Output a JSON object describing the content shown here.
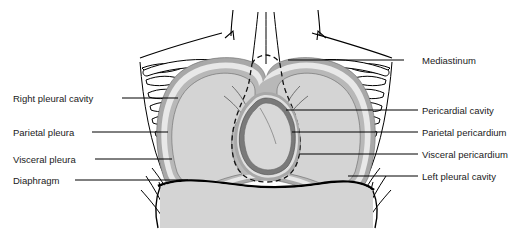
{
  "figure": {
    "type": "anatomical-diagram",
    "background_color": "#ffffff",
    "colors": {
      "outline": "#000000",
      "lung_fill": "#d4d4d4",
      "abdomen_fill": "#d4d4d4",
      "parietal_layer": "#a8a8a8",
      "visceral_layer": "#7a7a7a",
      "cavity_fill": "#e8e8e8",
      "heart_fill": "#d8d8d8",
      "label_text": "#1a1a1a",
      "leader_line": "#000000"
    }
  },
  "labels": {
    "left": [
      {
        "id": "right-pleural-cavity",
        "text": "Right pleural cavity",
        "text_x": 13,
        "text_y": 93,
        "line_x1": 122,
        "line_y1": 98,
        "line_x2": 178,
        "line_y2": 98
      },
      {
        "id": "parietal-pleura",
        "text": "Parietal pleura",
        "text_x": 13,
        "text_y": 127,
        "line_x1": 92,
        "line_y1": 132,
        "line_x2": 168,
        "line_y2": 132
      },
      {
        "id": "visceral-pleura",
        "text": "Visceral pleura",
        "text_x": 13,
        "text_y": 154,
        "line_x1": 95,
        "line_y1": 159,
        "line_x2": 172,
        "line_y2": 159
      },
      {
        "id": "diaphragm",
        "text": "Diaphragm",
        "text_x": 13,
        "text_y": 175,
        "line_x1": 75,
        "line_y1": 180,
        "line_x2": 188,
        "line_y2": 180
      }
    ],
    "right": [
      {
        "id": "mediastinum",
        "text": "Mediastinum",
        "text_x": 422,
        "text_y": 55,
        "line_x1": 404,
        "line_y1": 60,
        "line_x2": 288,
        "line_y2": 60
      },
      {
        "id": "pericardial-cavity",
        "text": "Pericardial cavity",
        "text_x": 422,
        "text_y": 105,
        "line_x1": 418,
        "line_y1": 110,
        "line_x2": 286,
        "line_y2": 110
      },
      {
        "id": "parietal-pericardium",
        "text": "Parietal pericardium",
        "text_x": 422,
        "text_y": 127,
        "line_x1": 418,
        "line_y1": 132,
        "line_x2": 292,
        "line_y2": 132
      },
      {
        "id": "visceral-pericardium",
        "text": "Visceral pericardium",
        "text_x": 422,
        "text_y": 149,
        "line_x1": 418,
        "line_y1": 154,
        "line_x2": 300,
        "line_y2": 154
      },
      {
        "id": "left-pleural-cavity",
        "text": "Left pleural cavity",
        "text_x": 422,
        "text_y": 171,
        "line_x1": 418,
        "line_y1": 176,
        "line_x2": 348,
        "line_y2": 176
      }
    ]
  }
}
